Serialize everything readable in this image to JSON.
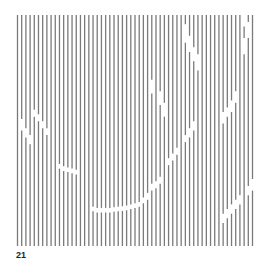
{
  "figure": {
    "label": "21",
    "line_color": "#7a7a7a",
    "background": "#ffffff",
    "line_count": 57,
    "gaps": [
      {
        "line": 1,
        "from": 0.45,
        "to": 0.5
      },
      {
        "line": 2,
        "from": 0.49,
        "to": 0.53
      },
      {
        "line": 3,
        "from": 0.52,
        "to": 0.56
      },
      {
        "line": 4,
        "from": 0.41,
        "to": 0.44
      },
      {
        "line": 5,
        "from": 0.43,
        "to": 0.46
      },
      {
        "line": 6,
        "from": 0.46,
        "to": 0.49
      },
      {
        "line": 7,
        "from": 0.49,
        "to": 0.52
      },
      {
        "line": 10,
        "from": 0.645,
        "to": 0.665
      },
      {
        "line": 11,
        "from": 0.655,
        "to": 0.675
      },
      {
        "line": 12,
        "from": 0.66,
        "to": 0.68
      },
      {
        "line": 13,
        "from": 0.665,
        "to": 0.685
      },
      {
        "line": 14,
        "from": 0.67,
        "to": 0.69
      },
      {
        "line": 18,
        "from": 0.83,
        "to": 0.85
      },
      {
        "line": 19,
        "from": 0.835,
        "to": 0.855
      },
      {
        "line": 20,
        "from": 0.835,
        "to": 0.855
      },
      {
        "line": 21,
        "from": 0.835,
        "to": 0.855
      },
      {
        "line": 22,
        "from": 0.835,
        "to": 0.855
      },
      {
        "line": 23,
        "from": 0.832,
        "to": 0.852
      },
      {
        "line": 24,
        "from": 0.83,
        "to": 0.85
      },
      {
        "line": 25,
        "from": 0.828,
        "to": 0.848
      },
      {
        "line": 26,
        "from": 0.825,
        "to": 0.845
      },
      {
        "line": 27,
        "from": 0.82,
        "to": 0.84
      },
      {
        "line": 28,
        "from": 0.815,
        "to": 0.835
      },
      {
        "line": 29,
        "from": 0.81,
        "to": 0.83
      },
      {
        "line": 30,
        "from": 0.79,
        "to": 0.815
      },
      {
        "line": 31,
        "from": 0.77,
        "to": 0.8
      },
      {
        "line": 32,
        "from": 0.73,
        "to": 0.76
      },
      {
        "line": 33,
        "from": 0.72,
        "to": 0.75
      },
      {
        "line": 34,
        "from": 0.7,
        "to": 0.73
      },
      {
        "line": 36,
        "from": 0.62,
        "to": 0.65
      },
      {
        "line": 37,
        "from": 0.6,
        "to": 0.63
      },
      {
        "line": 38,
        "from": 0.575,
        "to": 0.605
      },
      {
        "line": 40,
        "from": 0.52,
        "to": 0.55
      },
      {
        "line": 41,
        "from": 0.49,
        "to": 0.53
      },
      {
        "line": 42,
        "from": 0.46,
        "to": 0.5
      },
      {
        "line": 32,
        "from": 0.28,
        "to": 0.34
      },
      {
        "line": 34,
        "from": 0.33,
        "to": 0.39
      },
      {
        "line": 35,
        "from": 0.38,
        "to": 0.44
      },
      {
        "line": 40,
        "from": 0.04,
        "to": 0.12
      },
      {
        "line": 41,
        "from": 0.09,
        "to": 0.16
      },
      {
        "line": 42,
        "from": 0.14,
        "to": 0.2
      },
      {
        "line": 43,
        "from": 0.17,
        "to": 0.24
      },
      {
        "line": 54,
        "from": 0.0,
        "to": 0.05
      },
      {
        "line": 55,
        "from": 0.03,
        "to": 0.1
      },
      {
        "line": 54,
        "from": 0.1,
        "to": 0.17
      },
      {
        "line": 49,
        "from": 0.42,
        "to": 0.47
      },
      {
        "line": 50,
        "from": 0.4,
        "to": 0.44
      },
      {
        "line": 51,
        "from": 0.37,
        "to": 0.42
      },
      {
        "line": 52,
        "from": 0.33,
        "to": 0.38
      },
      {
        "line": 49,
        "from": 0.86,
        "to": 0.9
      },
      {
        "line": 50,
        "from": 0.84,
        "to": 0.88
      },
      {
        "line": 51,
        "from": 0.82,
        "to": 0.86
      },
      {
        "line": 52,
        "from": 0.8,
        "to": 0.84
      },
      {
        "line": 53,
        "from": 0.78,
        "to": 0.82
      },
      {
        "line": 55,
        "from": 0.74,
        "to": 0.78
      },
      {
        "line": 56,
        "from": 0.71,
        "to": 0.76
      }
    ]
  }
}
